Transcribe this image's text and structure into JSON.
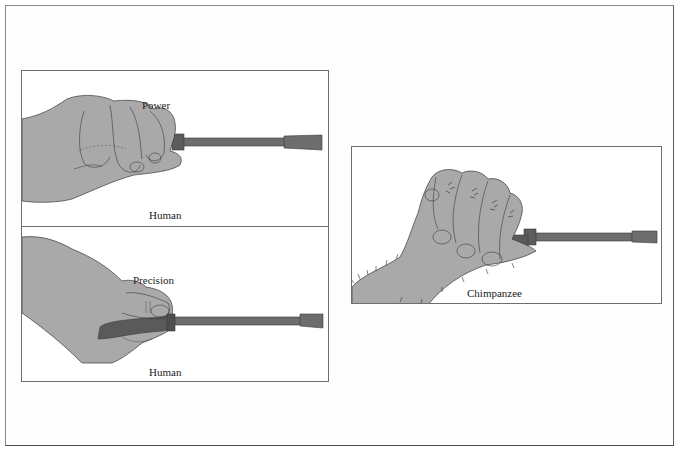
{
  "figure": {
    "panels": [
      {
        "id": "power",
        "grip_label": "Power",
        "species_label": "Human"
      },
      {
        "id": "precision",
        "grip_label": "Precision",
        "species_label": "Human"
      },
      {
        "id": "chimp",
        "species_label": "Chimpanzee"
      }
    ],
    "colors": {
      "skin": "#a9a9a9",
      "tool": "#6d6d6d",
      "outline": "#3a3a3a",
      "border": "#6e6e6e"
    }
  }
}
